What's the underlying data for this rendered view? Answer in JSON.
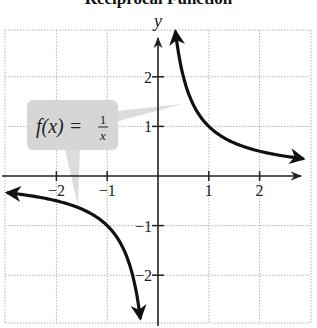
{
  "chart_data": {
    "type": "line",
    "title": "Reciprocal Function",
    "xlabel": "x",
    "ylabel": "y",
    "function": "f(x) = 1/x",
    "annotation": {
      "text_lhs": "f(x) = ",
      "numerator": "1",
      "denominator": "x",
      "pointers_to": [
        "right branch",
        "left branch"
      ]
    },
    "x_ticks": [
      -2,
      -1,
      1,
      2
    ],
    "y_ticks": [
      -2,
      -1,
      1,
      2
    ],
    "x_tick_labels": [
      "−2",
      "−1",
      "1",
      "2"
    ],
    "y_tick_labels": [
      "−2",
      "−1",
      "1",
      "2"
    ],
    "xlim": [
      -3,
      3
    ],
    "ylim": [
      -2.9,
      2.9
    ],
    "grid": true,
    "grid_style": "dotted",
    "series": [
      {
        "name": "right branch (x > 0)",
        "x": [
          0.34,
          0.4,
          0.5,
          0.6,
          0.75,
          1,
          1.25,
          1.5,
          2,
          2.5,
          2.85
        ],
        "y": [
          2.94,
          2.5,
          2,
          1.67,
          1.33,
          1,
          0.8,
          0.67,
          0.5,
          0.4,
          0.35
        ],
        "arrows": "both ends"
      },
      {
        "name": "left branch (x < 0)",
        "x": [
          -2.95,
          -2.5,
          -2,
          -1.5,
          -1,
          -0.75,
          -0.6,
          -0.5,
          -0.4,
          -0.34
        ],
        "y": [
          -0.34,
          -0.4,
          -0.5,
          -0.67,
          -1,
          -1.33,
          -1.67,
          -2,
          -2.5,
          -2.94
        ],
        "arrows": "both ends"
      }
    ]
  },
  "colors": {
    "curve": "#111111",
    "axis": "#222222",
    "grid": "#b5b5b5",
    "callout": "#d6d6d6"
  }
}
